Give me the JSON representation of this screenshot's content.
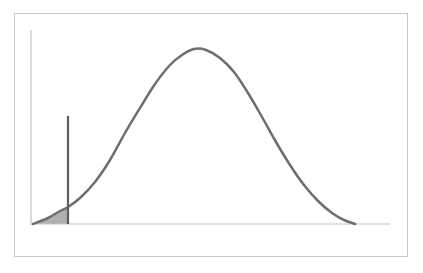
{
  "page": {
    "width": 423,
    "height": 273,
    "background_color": "#ffffff",
    "header_clipped_text": "— —— —— ——— —— ————",
    "header_text_color": "#b9b9bd"
  },
  "figure": {
    "frame_border_color": "#c8c8c8",
    "frame_fill_color": "#ffffff",
    "axis_color": "#c4c4c4",
    "curve_color": "#6e6e6e",
    "curve_width": 2.5,
    "critical_line_color": "#5f5f5f",
    "critical_line_width": 2.2,
    "shaded_region_color": "#b0b0b0",
    "shaded_region_opacity": 1
  },
  "chart_data": {
    "type": "line",
    "title": "",
    "subtitle": "",
    "xlabel": "",
    "ylabel": "",
    "grid": false,
    "legend": null,
    "axis_ticks": {
      "x": [],
      "y": []
    },
    "distribution": {
      "name": "normal",
      "mean_x_px": 194,
      "peak_y_px": 49,
      "baseline_y_px": 224,
      "left_tail_x_px": 33,
      "right_tail_x_px": 355
    },
    "critical_value": {
      "x_px": 68,
      "line_top_y_px": 116,
      "line_bottom_y_px": 224,
      "curve_intersection_y_px": 207
    },
    "shaded_region": {
      "side": "left-tail",
      "from_x_px": 31,
      "to_x_px": 68,
      "baseline_y_px": 224
    },
    "axes_px": {
      "y_axis_x": 31,
      "y_axis_top_y": 30,
      "y_axis_bottom_y": 225,
      "x_axis_y": 224,
      "x_axis_left_x": 31,
      "x_axis_right_x": 390
    },
    "curve_points_px": [
      [
        33,
        224
      ],
      [
        48,
        218
      ],
      [
        60,
        211
      ],
      [
        68,
        207
      ],
      [
        80,
        198
      ],
      [
        95,
        182
      ],
      [
        110,
        160
      ],
      [
        125,
        133
      ],
      [
        140,
        108
      ],
      [
        155,
        84
      ],
      [
        170,
        65
      ],
      [
        182,
        55
      ],
      [
        194,
        49
      ],
      [
        206,
        50
      ],
      [
        220,
        58
      ],
      [
        234,
        72
      ],
      [
        248,
        93
      ],
      [
        262,
        117
      ],
      [
        276,
        142
      ],
      [
        290,
        165
      ],
      [
        304,
        185
      ],
      [
        318,
        201
      ],
      [
        332,
        213
      ],
      [
        344,
        220
      ],
      [
        355,
        224
      ]
    ]
  }
}
